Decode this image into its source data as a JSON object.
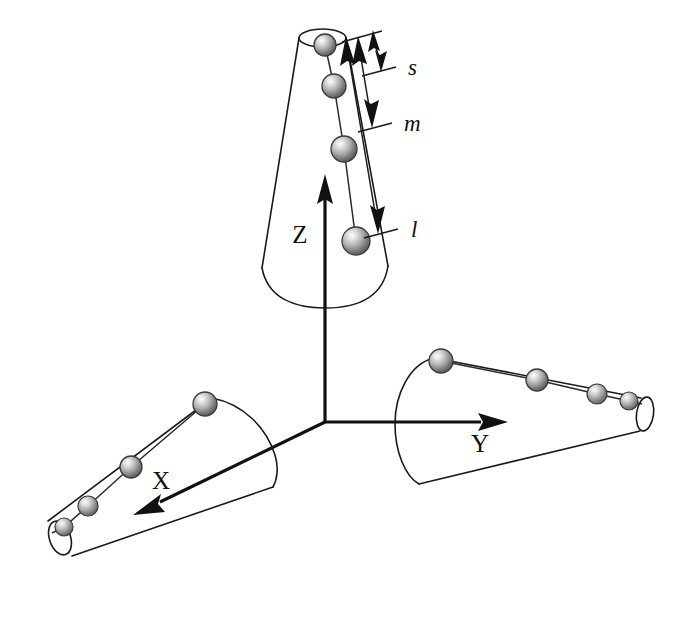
{
  "figure": {
    "background_color": "#ffffff",
    "line_color": "#1a1a1a",
    "width": 686,
    "height": 617
  },
  "axes": [
    {
      "id": "z",
      "label": "Z",
      "label_style": "upright",
      "label_x": 300,
      "label_y": 243,
      "arrow_from": [
        325,
        300
      ],
      "arrow_to": [
        325,
        178
      ],
      "direction": "up"
    },
    {
      "id": "x",
      "label": "X",
      "label_style": "upright",
      "label_x": 161,
      "label_y": 489,
      "arrow_from": [
        325,
        422
      ],
      "arrow_to": [
        135,
        514
      ],
      "direction": "down-left"
    },
    {
      "id": "y",
      "label": "Y",
      "label_style": "upright",
      "label_x": 480,
      "label_y": 452,
      "arrow_from": [
        325,
        422
      ],
      "arrow_to": [
        506,
        422
      ],
      "direction": "right"
    }
  ],
  "cones": [
    {
      "id": "cone-z",
      "axis": "z",
      "orientation": "vertical-up",
      "apex_end": "top",
      "bead_count": 4,
      "beads": [
        {
          "cx": 325,
          "cy": 45,
          "r": 11
        },
        {
          "cx": 334,
          "cy": 86,
          "r": 12
        },
        {
          "cx": 344,
          "cy": 149,
          "r": 13
        },
        {
          "cx": 356,
          "cy": 241,
          "r": 14
        }
      ]
    },
    {
      "id": "cone-x",
      "axis": "x",
      "orientation": "down-left",
      "apex_end": "lower-left",
      "bead_count": 4,
      "beads": [
        {
          "cx": 205,
          "cy": 404,
          "r": 12
        },
        {
          "cx": 131,
          "cy": 467,
          "r": 11
        },
        {
          "cx": 88,
          "cy": 506,
          "r": 10
        },
        {
          "cx": 64,
          "cy": 527,
          "r": 9
        }
      ]
    },
    {
      "id": "cone-y",
      "axis": "y",
      "orientation": "right",
      "apex_end": "right",
      "bead_count": 4,
      "beads": [
        {
          "cx": 441,
          "cy": 361,
          "r": 12
        },
        {
          "cx": 537,
          "cy": 380,
          "r": 11
        },
        {
          "cx": 597,
          "cy": 394,
          "r": 10
        },
        {
          "cx": 629,
          "cy": 401,
          "r": 9
        }
      ]
    }
  ],
  "measurements": [
    {
      "id": "measure-s",
      "label": "s",
      "label_x": 408,
      "label_y": 74,
      "span_top": [
        375,
        38
      ],
      "span_bottom": [
        379,
        66
      ],
      "tick_x_end": 394,
      "description": "small spacing"
    },
    {
      "id": "measure-m",
      "label": "m",
      "label_x": 404,
      "label_y": 130,
      "span_top": [
        360,
        40
      ],
      "span_bottom": [
        371,
        122
      ],
      "tick_x_end": 390,
      "description": "medium spacing"
    },
    {
      "id": "measure-l",
      "label": "l",
      "label_x": 411,
      "label_y": 237,
      "span_top": [
        348,
        42
      ],
      "span_bottom": [
        376,
        228
      ],
      "tick_x_end": 396,
      "description": "large spacing"
    }
  ],
  "bead_style": {
    "fill_light": "#f2f2f2",
    "fill_mid": "#b8b8b8",
    "fill_dark": "#636363",
    "outline": "#3a3a3a"
  }
}
